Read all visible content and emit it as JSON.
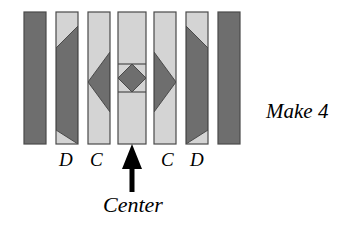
{
  "figure": {
    "title_caption": "Strip-pieced quilt block assembly diagram",
    "make_label": "Make 4",
    "center_label": "Center",
    "strip_labels": [
      {
        "id": "D-left",
        "text": "D"
      },
      {
        "id": "C-left",
        "text": "C"
      },
      {
        "id": "C-right",
        "text": "C"
      },
      {
        "id": "D-right",
        "text": "D"
      }
    ],
    "arrow": {
      "name": "center-pointer-arrow",
      "points_to": "center-strip",
      "direction": "up"
    },
    "colors": {
      "dark_fabric": "#6e6e6e",
      "light_fabric": "#d4d4d4",
      "outline": "#4a4a4a",
      "background": "#ffffff",
      "text": "#000000",
      "arrow": "#000000"
    },
    "strips": [
      {
        "index": 1,
        "name": "strip-solid-dark-left",
        "label": "",
        "fabric": "dark",
        "pattern": "solid-dark",
        "x": 24,
        "width": 22
      },
      {
        "index": 2,
        "name": "strip-D-left",
        "label": "D",
        "fabric": "light-with-dark-diagonal",
        "pattern": "parallelogram-top-right-to-bottom-left",
        "x": 56,
        "width": 22
      },
      {
        "index": 3,
        "name": "strip-C-left",
        "label": "C",
        "fabric": "light-with-dark-chevron",
        "pattern": "chevron-pointing-left",
        "x": 88,
        "width": 22
      },
      {
        "index": 4,
        "name": "strip-center",
        "label": "Center",
        "fabric": "light-with-dark-diamond",
        "pattern": "diamond-on-point-with-seam-lines",
        "x": 118,
        "width": 28
      },
      {
        "index": 5,
        "name": "strip-C-right",
        "label": "C",
        "fabric": "light-with-dark-chevron",
        "pattern": "chevron-pointing-right",
        "x": 154,
        "width": 22
      },
      {
        "index": 6,
        "name": "strip-D-right",
        "label": "D",
        "fabric": "light-with-dark-diagonal",
        "pattern": "parallelogram-top-left-to-bottom-right",
        "x": 186,
        "width": 22
      },
      {
        "index": 7,
        "name": "strip-solid-dark-right",
        "label": "",
        "fabric": "dark",
        "pattern": "solid-dark",
        "x": 218,
        "width": 22
      }
    ],
    "strip_geometry": {
      "top": 12,
      "bottom": 144,
      "height": 132
    }
  }
}
